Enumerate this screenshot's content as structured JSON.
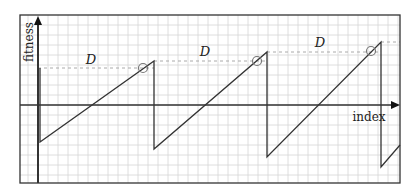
{
  "diagram": {
    "frame": {
      "x0": 20,
      "y0": 15,
      "x1": 400,
      "y1": 183
    },
    "grid": {
      "spacing": 10,
      "color": "#d6d6d6"
    },
    "colors": {
      "line": "#333333",
      "dashed": "#aaaaaa",
      "frame": "#333333",
      "marker": "#777777"
    },
    "axes": {
      "y_label": "fitness",
      "x_label": "index",
      "origin": {
        "x": 38,
        "y": 105
      },
      "y_arrow_tip": {
        "x": 38,
        "y": 16
      },
      "x_arrow_tip": {
        "x": 400,
        "y": 105
      }
    },
    "labels": [
      {
        "text": "D",
        "x": 91,
        "y": 64
      },
      {
        "text": "D",
        "x": 205,
        "y": 56
      },
      {
        "text": "D",
        "x": 320,
        "y": 47
      }
    ],
    "sawtooth": [
      {
        "start": {
          "x": 40,
          "y": 142
        },
        "peak": {
          "x": 154,
          "y": 61
        },
        "drop": {
          "x": 154,
          "y": 149
        }
      },
      {
        "start": {
          "x": 154,
          "y": 149
        },
        "peak": {
          "x": 267,
          "y": 52
        },
        "drop": {
          "x": 267,
          "y": 157
        }
      },
      {
        "start": {
          "x": 267,
          "y": 157
        },
        "peak": {
          "x": 381,
          "y": 42
        },
        "drop": {
          "x": 381,
          "y": 167
        }
      },
      {
        "start": {
          "x": 381,
          "y": 167
        },
        "peak": {
          "x": 400,
          "y": 145
        },
        "drop": null
      }
    ],
    "markers": [
      {
        "x": 143,
        "y": 68
      },
      {
        "x": 257,
        "y": 61
      },
      {
        "x": 371,
        "y": 51
      }
    ],
    "dashed_lines": [
      {
        "x1": 38,
        "y1": 68,
        "x2": 154,
        "y2": 68
      },
      {
        "x1": 154,
        "y1": 61,
        "x2": 267,
        "y2": 61
      },
      {
        "x1": 267,
        "y1": 52,
        "x2": 381,
        "y2": 52
      },
      {
        "x1": 381,
        "y1": 42,
        "x2": 400,
        "y2": 42
      }
    ]
  }
}
